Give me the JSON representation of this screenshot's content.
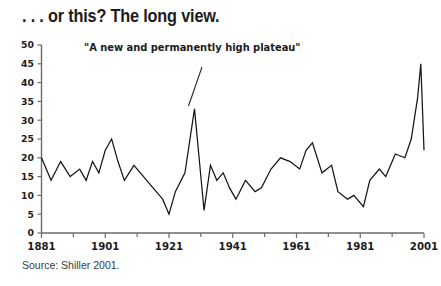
{
  "headline": ". . . or this? The long view.",
  "source": "Source: Shiller 2001.",
  "annotation": "\"A new and permanently high plateau\"",
  "colors": {
    "background": "#ffffff",
    "line": "#161616",
    "axis": "#6b6b6b",
    "text": "#1c1c1c",
    "source_text": "#3a3a3a"
  },
  "chart_data": {
    "type": "line",
    "title": ". . . or this? The long view.",
    "subtitle": "",
    "xlabel": "",
    "ylabel": "",
    "xlim": [
      1881,
      2001
    ],
    "ylim": [
      0,
      50
    ],
    "grid": false,
    "legend": false,
    "annotations": [
      {
        "text": "\"A new and permanently high plateau\"",
        "points_to_year": 1929,
        "points_to_value": 33
      }
    ],
    "xticks": [
      1881,
      1901,
      1921,
      1941,
      1961,
      1981,
      2001
    ],
    "xticklabels": [
      "1881",
      "1901",
      "1921",
      "1941",
      "1961",
      "1981",
      "2001"
    ],
    "xminor_ticks": [
      1891,
      1911,
      1931,
      1951,
      1971,
      1991
    ],
    "yticks": [
      0,
      5,
      10,
      15,
      20,
      25,
      30,
      35,
      40,
      45,
      50
    ],
    "yticklabels": [
      "0",
      "5",
      "10",
      "15",
      "20",
      "25",
      "30",
      "35",
      "40",
      "45",
      "50"
    ],
    "series": [
      {
        "name": "Price-earnings ratio",
        "x": [
          1881,
          1884,
          1887,
          1890,
          1893,
          1895,
          1897,
          1899,
          1901,
          1903,
          1905,
          1907,
          1910,
          1913,
          1915,
          1917,
          1919,
          1921,
          1923,
          1926,
          1929,
          1932,
          1934,
          1936,
          1938,
          1940,
          1942,
          1945,
          1948,
          1950,
          1953,
          1956,
          1959,
          1962,
          1964,
          1966,
          1969,
          1972,
          1974,
          1977,
          1979,
          1982,
          1984,
          1987,
          1989,
          1992,
          1995,
          1997,
          1999,
          2000,
          2001
        ],
        "values": [
          20,
          14,
          19,
          15,
          17,
          14,
          19,
          16,
          22,
          25,
          19,
          14,
          18,
          15,
          13,
          11,
          9,
          5,
          11,
          16,
          33,
          6,
          18,
          14,
          16,
          12,
          9,
          14,
          11,
          12,
          17,
          20,
          19,
          17,
          22,
          24,
          16,
          18,
          11,
          9,
          10,
          7,
          14,
          17,
          15,
          21,
          20,
          25,
          36,
          45,
          22
        ]
      }
    ]
  }
}
